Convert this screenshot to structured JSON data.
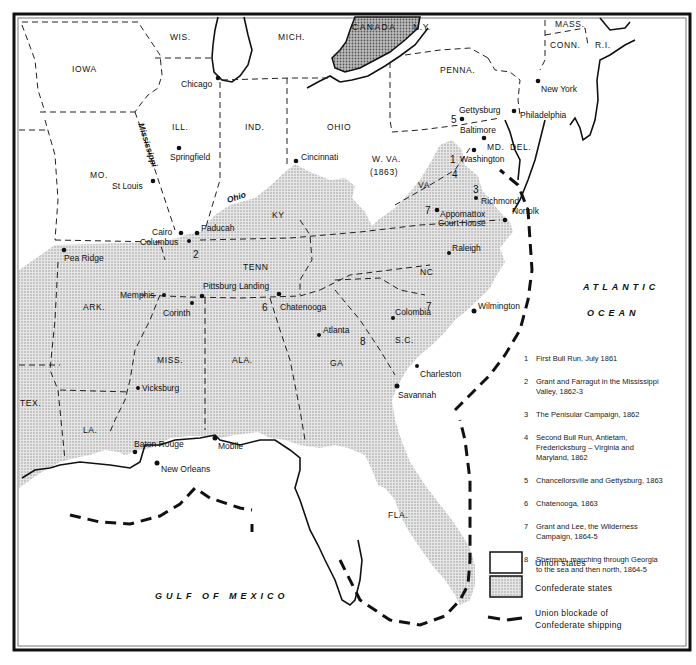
{
  "map": {
    "title": "American Civil War campaigns",
    "colors": {
      "union": "#ffffff",
      "confederate": "#d4d4d4",
      "ink": "#111111",
      "canada": "#a9a9a9"
    },
    "states": {
      "union": [
        "IOWA",
        "WIS.",
        "MICH.",
        "N.Y.",
        "MASS.",
        "CONN.",
        "R.I.",
        "PENNA.",
        "ILL.",
        "IND.",
        "OHIO",
        "MO.",
        "W. VA.",
        "(1863)",
        "MD.",
        "DEL."
      ],
      "confederate": [
        "VA",
        "KY",
        "TENN",
        "NC",
        "ARK.",
        "MISS.",
        "ALA.",
        "GA",
        "S.C.",
        "TEX.",
        "LA.",
        "FLA."
      ],
      "other": [
        "CANADA"
      ]
    },
    "cities": [
      "Chicago",
      "New York",
      "Gettysburg",
      "Philadelphia",
      "Baltimore",
      "Washington",
      "Springfield",
      "St Louis",
      "Cincinnati",
      "Richmond",
      "Appomattox",
      "Court House",
      "Norfolk",
      "Cairo",
      "Paducah",
      "Columbus",
      "Pea Ridge",
      "Raleigh",
      "Memphis",
      "Pittsburg Landing",
      "Corinth",
      "Chatenooga",
      "Colombia",
      "Atlanta",
      "Wilmington",
      "Charleston",
      "Savannah",
      "Vicksburg",
      "Baton Rouge",
      "Mobile",
      "New Orleans"
    ],
    "rivers": [
      "Mississippi",
      "Ohio"
    ],
    "seas": [
      "ATLANTIC",
      "OCEAN",
      "GULF OF MEXICO"
    ],
    "campaign_markers": [
      "1",
      "2",
      "3",
      "4",
      "5",
      "6",
      "7",
      "8"
    ]
  },
  "legend": {
    "campaigns": [
      {
        "num": "1",
        "lines": [
          "First Bull Run, July 1861"
        ]
      },
      {
        "num": "2",
        "lines": [
          "Grant and Farragut in the Mississippi",
          "Valley, 1862-3"
        ]
      },
      {
        "num": "3",
        "lines": [
          "The Penisular Campaign, 1862"
        ]
      },
      {
        "num": "4",
        "lines": [
          "Second Bull Run, Antietam,",
          "Fredericksburg – Virginia and",
          "Maryland, 1862"
        ]
      },
      {
        "num": "5",
        "lines": [
          "Chancellorsville and Gettysburg, 1863"
        ]
      },
      {
        "num": "6",
        "lines": [
          "Chatenooga, 1863"
        ]
      },
      {
        "num": "7",
        "lines": [
          "Grant and Lee, the Wilderness",
          "Campaign, 1864-5"
        ]
      },
      {
        "num": "8",
        "lines": [
          "Sherman, marching through Georgia",
          "to the sea and then north, 1864-5"
        ]
      }
    ],
    "keys": {
      "union": "Union states",
      "confederate": "Confederate states",
      "blockade_1": "Union blockade of",
      "blockade_2": "Confederate shipping"
    }
  }
}
